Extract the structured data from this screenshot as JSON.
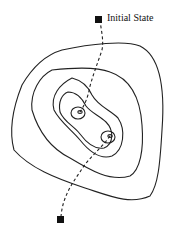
{
  "diagram": {
    "type": "contour-map-with-path",
    "labels": {
      "start": "Initial State"
    },
    "colors": {
      "line": "#222222",
      "marker": "#111111",
      "background": "#ffffff"
    },
    "contours": 5,
    "local_minima": 2
  }
}
